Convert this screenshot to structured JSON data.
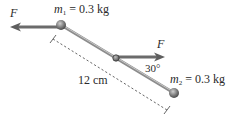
{
  "diagram": {
    "type": "physics-free-body",
    "mass1": {
      "symbol": "m",
      "subscript": "1",
      "equals": " = ",
      "value": "0.3 kg"
    },
    "mass2": {
      "symbol": "m",
      "subscript": "2",
      "equals": " = ",
      "value": "0.3 kg"
    },
    "force_left": {
      "label": "F"
    },
    "force_right": {
      "label": "F"
    },
    "angle": {
      "label": "30°"
    },
    "length": {
      "label": "12 cm"
    },
    "colors": {
      "rod": "#9a9a9a",
      "arrow": "#6e6e6e",
      "ball": "#7a7a7a",
      "dashes": "#555555",
      "text": "#2a2a2a"
    }
  }
}
